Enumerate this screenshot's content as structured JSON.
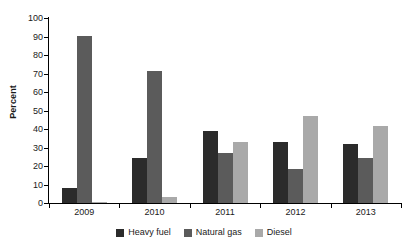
{
  "chart_data": {
    "type": "bar",
    "title": "",
    "xlabel": "",
    "ylabel": "Percent",
    "categories": [
      "2009",
      "2010",
      "2011",
      "2012",
      "2013"
    ],
    "series": [
      {
        "name": "Heavy fuel",
        "color": "#2b2b2b",
        "values": [
          8,
          24.5,
          39,
          33,
          32
        ]
      },
      {
        "name": "Natural gas",
        "color": "#5b5b5b",
        "values": [
          90.5,
          71.5,
          27,
          18.5,
          24.5
        ]
      },
      {
        "name": "Diesel",
        "color": "#a9a9a9",
        "values": [
          0.5,
          3,
          33,
          47,
          41.5
        ]
      }
    ],
    "ylim": [
      0,
      100
    ],
    "ytick_step": 10,
    "yticks": [
      "0",
      "10",
      "20",
      "30",
      "40",
      "50",
      "60",
      "70",
      "80",
      "90",
      "100"
    ],
    "grid": false,
    "legend_position": "bottom"
  }
}
